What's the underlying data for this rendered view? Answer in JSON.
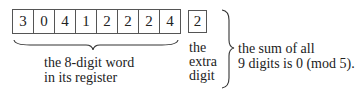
{
  "register": {
    "digits": [
      "3",
      "0",
      "4",
      "1",
      "2",
      "2",
      "2",
      "4"
    ],
    "label_line1": "the 8-digit word",
    "label_line2": "in its register"
  },
  "extra": {
    "digit": "2",
    "label_line1": "the",
    "label_line2": "extra",
    "label_line3": "digit"
  },
  "conclusion": {
    "line1": "the sum of all",
    "line2": "9 digits is 0 (mod 5)."
  }
}
